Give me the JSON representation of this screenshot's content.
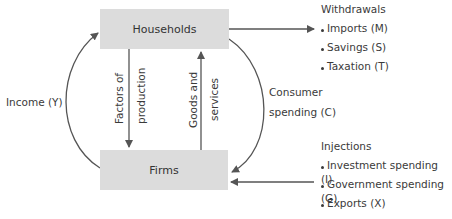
{
  "diagram": {
    "nodes": {
      "households": "Households",
      "firms": "Firms"
    },
    "flows": {
      "income": "Income (Y)",
      "factors_line1": "Factors of",
      "factors_line2": "production",
      "goods_line1": "Goods and",
      "goods_line2": "services",
      "consumer_line1": "Consumer",
      "consumer_line2": "spending (C)"
    },
    "withdrawals": {
      "title": "Withdrawals",
      "items": [
        "Imports (M)",
        "Savings (S)",
        "Taxation (T)"
      ]
    },
    "injections": {
      "title": "Injections",
      "items": [
        "Investment spending (I)",
        "Government spending (G)",
        "Exports (X)"
      ]
    },
    "colors": {
      "box_fill": "#dcdcdc",
      "arrow": "#555555",
      "text": "#3a3a3a"
    }
  }
}
